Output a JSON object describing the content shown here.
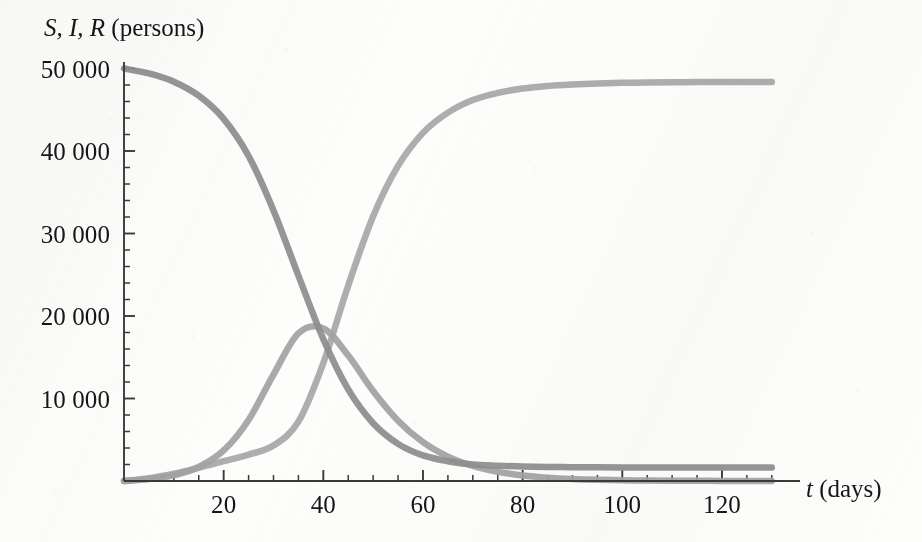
{
  "chart_data": {
    "type": "line",
    "title": "",
    "subtitle": "",
    "xlabel": "t (days)",
    "xlabel_variable": "t",
    "xlabel_unit": "(days)",
    "ylabel": "S, I, R (persons)",
    "ylabel_variables": "S, I, R",
    "ylabel_unit": "(persons)",
    "xlim": [
      0,
      130
    ],
    "ylim": [
      0,
      50500
    ],
    "grid": false,
    "legend": "none",
    "x_major_ticks": [
      20,
      40,
      60,
      80,
      100,
      120
    ],
    "x_major_tick_labels": [
      "20",
      "40",
      "60",
      "80",
      "100",
      "120"
    ],
    "x_minor_tick_step": 5,
    "y_major_ticks": [
      10000,
      20000,
      30000,
      40000,
      50000
    ],
    "y_major_tick_labels": [
      "10 000",
      "20 000",
      "30 000",
      "40 000",
      "50 000"
    ],
    "y_minor_tick_step": 2000,
    "series": [
      {
        "name": "S",
        "description": "Susceptible",
        "color": "#8e8e8e",
        "x": [
          0,
          5,
          10,
          15,
          20,
          25,
          30,
          35,
          40,
          45,
          50,
          55,
          60,
          65,
          70,
          75,
          80,
          85,
          90,
          95,
          100,
          105,
          110,
          115,
          120,
          125,
          130
        ],
        "values": [
          49999,
          49400,
          48400,
          46700,
          43900,
          39400,
          32800,
          24900,
          17200,
          11100,
          7000,
          4500,
          3100,
          2400,
          2000,
          1850,
          1750,
          1700,
          1680,
          1660,
          1650,
          1640,
          1635,
          1630,
          1628,
          1626,
          1625
        ]
      },
      {
        "name": "I",
        "description": "Infected",
        "color": "#a3a3a3",
        "x": [
          0,
          5,
          10,
          15,
          20,
          25,
          30,
          35,
          40,
          45,
          50,
          55,
          60,
          65,
          70,
          75,
          80,
          85,
          90,
          95,
          100,
          105,
          110,
          115,
          120,
          125,
          130
        ],
        "values": [
          1,
          250,
          700,
          1700,
          3700,
          7400,
          12900,
          17900,
          18500,
          15200,
          10900,
          7300,
          4700,
          2950,
          1820,
          1110,
          675,
          408,
          246,
          148,
          89,
          54,
          32,
          19,
          12,
          7,
          4
        ]
      },
      {
        "name": "R",
        "description": "Recovered",
        "color": "#a8a8a8",
        "x": [
          0,
          5,
          10,
          15,
          20,
          25,
          30,
          35,
          40,
          45,
          50,
          55,
          60,
          65,
          70,
          75,
          80,
          85,
          90,
          95,
          100,
          105,
          110,
          115,
          120,
          125,
          130
        ],
        "values": [
          0,
          350,
          900,
          1600,
          2400,
          3200,
          4300,
          7200,
          14300,
          23700,
          32100,
          38200,
          42200,
          44650,
          46180,
          47040,
          47575,
          47892,
          48074,
          48192,
          48261,
          48306,
          48333,
          48351,
          48360,
          48367,
          48371
        ]
      }
    ],
    "annotations": {
      "peak_infected_value": 18500,
      "peak_infected_day": 37,
      "initial_susceptible": 49999,
      "final_recovered": 48000
    }
  },
  "colors": {
    "axis": "#3a3a3a",
    "text": "#161616",
    "background": "#fdfdfc",
    "series_s": "#8e8e8e",
    "series_i": "#a3a3a3",
    "series_r": "#a8a8a8"
  }
}
